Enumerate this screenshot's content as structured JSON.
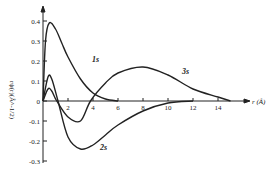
{
  "chart_data": {
    "type": "line",
    "title": "",
    "xlabel": "r (Å)",
    "ylabel": "rψ(r)(Å^-1/2)",
    "xlim": [
      0,
      16
    ],
    "ylim": [
      -0.3,
      0.42
    ],
    "xticks": [
      "2",
      "4",
      "6",
      "8",
      "10",
      "12",
      "14"
    ],
    "yticks": [
      "0.4",
      "0.3",
      "0.2",
      "0.1",
      "0",
      "-0.1",
      "-0.2",
      "-0.3"
    ],
    "grid": false,
    "series": [
      {
        "name": "1s",
        "x": [
          0,
          0.2,
          0.5,
          1,
          1.5,
          2,
          3,
          4,
          5,
          6
        ],
        "values": [
          0,
          0.3,
          0.39,
          0.36,
          0.29,
          0.22,
          0.11,
          0.04,
          0.01,
          0
        ]
      },
      {
        "name": "2s",
        "x": [
          0,
          0.4,
          0.7,
          1.2,
          2,
          3,
          4,
          5,
          6,
          8,
          10,
          12
        ],
        "values": [
          0,
          0.12,
          0.11,
          0,
          -0.18,
          -0.24,
          -0.22,
          -0.17,
          -0.12,
          -0.05,
          -0.01,
          0
        ]
      },
      {
        "name": "3s",
        "x": [
          0,
          0.4,
          0.7,
          1.1,
          2,
          3,
          3.8,
          5,
          6,
          8,
          10,
          12,
          14,
          15
        ],
        "values": [
          0,
          0.06,
          0.05,
          0,
          -0.08,
          -0.1,
          0,
          0.09,
          0.14,
          0.17,
          0.13,
          0.06,
          0.02,
          0
        ]
      }
    ]
  }
}
